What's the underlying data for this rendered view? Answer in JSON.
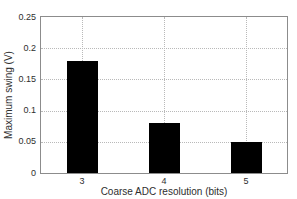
{
  "chart_data": {
    "type": "bar",
    "title": "",
    "categories": [
      "3",
      "4",
      "5"
    ],
    "values": [
      0.18,
      0.08,
      0.05
    ],
    "xlabel": "Coarse ADC resolution (bits)",
    "ylabel": "Maximum swing (V)",
    "ylim": [
      0,
      0.25
    ],
    "yticks": [
      0,
      0.05,
      0.1,
      0.15,
      0.2,
      0.25
    ],
    "ytick_labels": [
      "0",
      "0.05",
      "0.1",
      "0.15",
      "0.2",
      "0.25"
    ],
    "grid": true,
    "legend": "none",
    "bar_color": "#000000",
    "grid_color": "#b9b9b9",
    "box_color": "#8c8c8c",
    "text_color": "#2e2e2e",
    "background_color": "#ffffff"
  }
}
